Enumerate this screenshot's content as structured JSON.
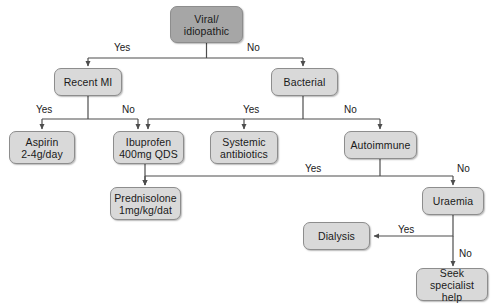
{
  "diagram": {
    "colors": {
      "root_fill": "#a6a6a6",
      "node_fill": "#d9d9d9",
      "node_stroke": "#8d8d8d",
      "edge_stroke": "#4d4d4d",
      "text": "#1a1a1a",
      "background": "#ffffff"
    },
    "nodes": [
      {
        "id": "viral",
        "label": "Viral/\nidiopathic",
        "x": 170,
        "y": 6,
        "w": 73,
        "h": 37,
        "root": true
      },
      {
        "id": "recent_mi",
        "label": "Recent MI",
        "x": 54,
        "y": 68,
        "w": 68,
        "h": 28,
        "root": false
      },
      {
        "id": "bacterial",
        "label": "Bacterial",
        "x": 271,
        "y": 68,
        "w": 67,
        "h": 28,
        "root": false
      },
      {
        "id": "aspirin",
        "label": "Aspirin\n2-4g/day",
        "x": 9,
        "y": 131,
        "w": 66,
        "h": 33,
        "root": false
      },
      {
        "id": "ibuprofen",
        "label": "Ibuprofen\n400mg QDS",
        "x": 113,
        "y": 131,
        "w": 71,
        "h": 33,
        "root": false
      },
      {
        "id": "systemic",
        "label": "Systemic\nantibiotics",
        "x": 210,
        "y": 131,
        "w": 68,
        "h": 33,
        "root": false
      },
      {
        "id": "autoimmune",
        "label": "Autoimmune",
        "x": 344,
        "y": 131,
        "w": 73,
        "h": 28,
        "root": false
      },
      {
        "id": "prednisolone",
        "label": "Prednisolone\n1mg/kg/dat",
        "x": 110,
        "y": 187,
        "w": 71,
        "h": 33,
        "root": false
      },
      {
        "id": "uraemia",
        "label": "Uraemia",
        "x": 422,
        "y": 187,
        "w": 62,
        "h": 28,
        "root": false
      },
      {
        "id": "dialysis",
        "label": "Dialysis",
        "x": 303,
        "y": 222,
        "w": 67,
        "h": 28,
        "root": false
      },
      {
        "id": "seek",
        "label": "Seek specialist\nhelp",
        "x": 416,
        "y": 268,
        "w": 72,
        "h": 33,
        "root": false
      }
    ],
    "edge_labels": [
      {
        "id": "viral-yes",
        "text": "Yes",
        "x": 114,
        "y": 42
      },
      {
        "id": "viral-no",
        "text": "No",
        "x": 247,
        "y": 42
      },
      {
        "id": "mi-yes",
        "text": "Yes",
        "x": 36,
        "y": 104
      },
      {
        "id": "mi-no",
        "text": "No",
        "x": 122,
        "y": 104
      },
      {
        "id": "bacterial-yes",
        "text": "Yes",
        "x": 243,
        "y": 104
      },
      {
        "id": "bacterial-no",
        "text": "No",
        "x": 344,
        "y": 104
      },
      {
        "id": "autoimmune-yes",
        "text": "Yes",
        "x": 305,
        "y": 163
      },
      {
        "id": "autoimmune-no",
        "text": "No",
        "x": 457,
        "y": 163
      },
      {
        "id": "uraemia-yes",
        "text": "Yes",
        "x": 398,
        "y": 224
      },
      {
        "id": "uraemia-no",
        "text": "No",
        "x": 459,
        "y": 248
      }
    ],
    "connections": [
      {
        "from": "viral",
        "to": "recent_mi",
        "label": "Yes"
      },
      {
        "from": "viral",
        "to": "bacterial",
        "label": "No"
      },
      {
        "from": "recent_mi",
        "to": "aspirin",
        "label": "Yes"
      },
      {
        "from": "recent_mi",
        "to": "ibuprofen",
        "label": "No"
      },
      {
        "from": "bacterial",
        "to": "ibuprofen",
        "label": "Yes"
      },
      {
        "from": "bacterial",
        "to": "systemic",
        "label": "Yes"
      },
      {
        "from": "bacterial",
        "to": "autoimmune",
        "label": "No"
      },
      {
        "from": "autoimmune",
        "to": "prednisolone",
        "label": "Yes"
      },
      {
        "from": "autoimmune",
        "to": "uraemia",
        "label": "No"
      },
      {
        "from": "uraemia",
        "to": "dialysis",
        "label": "Yes"
      },
      {
        "from": "uraemia",
        "to": "seek",
        "label": "No"
      }
    ]
  }
}
